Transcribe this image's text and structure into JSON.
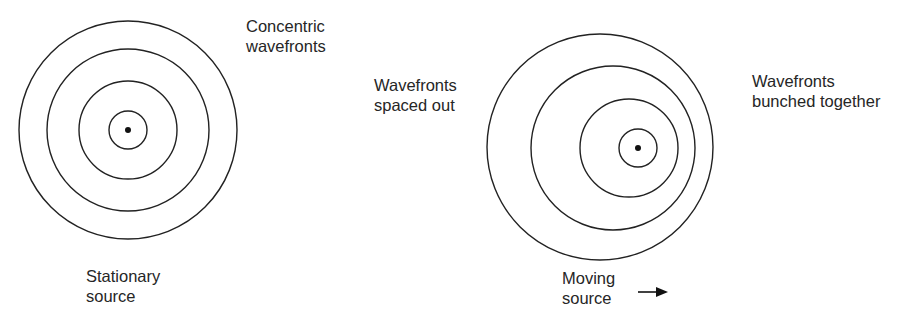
{
  "stationary": {
    "label_wavefronts": "Concentric\nwavefronts",
    "label_source": "Stationary\nsource",
    "center": [
      128,
      130
    ],
    "radii": [
      19,
      49,
      81,
      109
    ]
  },
  "moving": {
    "label_spaced": "Wavefronts\nspaced out",
    "label_bunched": "Wavefronts\nbunched together",
    "label_source": "Moving\nsource",
    "circles": [
      {
        "cx": 600,
        "cy": 147,
        "r": 113
      },
      {
        "cx": 613,
        "cy": 148,
        "r": 82
      },
      {
        "cx": 629,
        "cy": 148,
        "r": 49
      },
      {
        "cx": 638,
        "cy": 148,
        "r": 19
      }
    ],
    "source": [
      638,
      148
    ],
    "direction": "right"
  },
  "colors": {
    "stroke": "#222222",
    "text": "#262626"
  }
}
